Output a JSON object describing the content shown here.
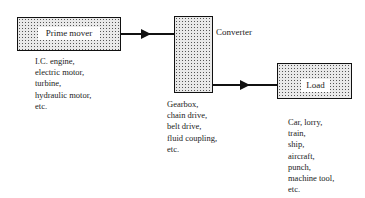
{
  "diagram": {
    "nodes": [
      {
        "id": "prime-mover",
        "label": "Prime mover",
        "examples": [
          "I.C. engine,",
          "electric motor,",
          "turbine,",
          "hydraulic motor,",
          "etc."
        ]
      },
      {
        "id": "converter",
        "label": "Converter",
        "examples": [
          "Gearbox,",
          "chain drive,",
          "belt drive,",
          "fluid coupling,",
          "etc."
        ]
      },
      {
        "id": "load",
        "label": "Load",
        "examples": [
          "Car, lorry,",
          "train,",
          "ship,",
          "aircraft,",
          "punch,",
          "machine tool,",
          "etc."
        ]
      }
    ],
    "edges": [
      {
        "from": "prime-mover",
        "to": "converter"
      },
      {
        "from": "converter",
        "to": "load"
      }
    ]
  }
}
